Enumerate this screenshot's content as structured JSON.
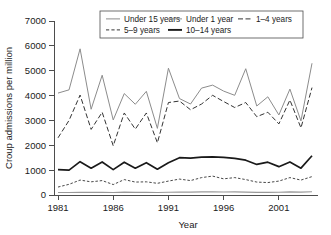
{
  "chart_data": {
    "type": "line",
    "title": "",
    "xlabel": "Year",
    "ylabel": "Croup admissions per million",
    "xlim": [
      1981,
      2004
    ],
    "ylim": [
      0,
      7000
    ],
    "grid": false,
    "legend_position": "top-right-inside",
    "x": [
      1981,
      1982,
      1983,
      1984,
      1985,
      1986,
      1987,
      1988,
      1989,
      1990,
      1991,
      1992,
      1993,
      1994,
      1995,
      1996,
      1997,
      1998,
      1999,
      2000,
      2001,
      2002,
      2003,
      2004
    ],
    "xticks": [
      1981,
      1986,
      1991,
      1996,
      2001
    ],
    "xtick_labels": [
      "1981",
      "1986",
      "1991",
      "1996",
      "2001"
    ],
    "yticks": [
      0,
      1000,
      2000,
      3000,
      4000,
      5000,
      6000,
      7000
    ],
    "ytick_labels": [
      "0",
      "1000",
      "2000",
      "3000",
      "4000",
      "5000",
      "6000",
      "7000"
    ],
    "series": [
      {
        "name": "Under 15 years",
        "style": "solid-thin",
        "color": "#8c8c8c",
        "width": 1.0,
        "dash": "",
        "values": [
          4100,
          4230,
          5880,
          3450,
          4820,
          3020,
          4080,
          3650,
          4170,
          2680,
          5100,
          3880,
          3660,
          4300,
          4420,
          4180,
          4010,
          5080,
          3580,
          3950,
          3220,
          4260,
          2980,
          5300
        ]
      },
      {
        "name": "Under 1 year",
        "style": "solid-thin",
        "color": "#8c8c8c",
        "width": 1.0,
        "dash": "",
        "values": [
          null,
          null,
          null,
          null,
          null,
          null,
          null,
          null,
          null,
          null,
          null,
          null,
          null,
          null,
          null,
          null,
          null,
          null,
          null,
          null,
          null,
          null,
          null,
          null
        ]
      },
      {
        "name": "1-4 years",
        "style": "dashed",
        "color": "#333333",
        "width": 1.0,
        "dash": "5,2.5",
        "values": [
          2300,
          3000,
          4020,
          2640,
          3330,
          1980,
          3300,
          2650,
          3300,
          2100,
          3720,
          3780,
          3430,
          3660,
          4010,
          3760,
          3520,
          3720,
          3150,
          3330,
          2860,
          3820,
          2700,
          4320
        ]
      },
      {
        "name": "5-9 years",
        "style": "dashed-short",
        "color": "#333333",
        "width": 0.9,
        "dash": "2.5,1.8",
        "values": [
          320,
          430,
          600,
          530,
          580,
          420,
          620,
          520,
          530,
          470,
          560,
          640,
          580,
          700,
          760,
          650,
          700,
          620,
          520,
          500,
          560,
          700,
          600,
          740
        ]
      },
      {
        "name": "10-14 years",
        "style": "solid-thick",
        "color": "#1a1a1a",
        "width": 1.7,
        "dash": "",
        "values": [
          1020,
          1000,
          1340,
          1080,
          1330,
          1020,
          1320,
          1080,
          1300,
          1040,
          1300,
          1500,
          1480,
          1520,
          1530,
          1510,
          1470,
          1400,
          1230,
          1320,
          1140,
          1330,
          1080,
          1580
        ]
      }
    ],
    "baseline_series": {
      "name": "baseline-10-14",
      "color": "#999999",
      "width": 1.2,
      "values": [
        100,
        100,
        110,
        105,
        110,
        100,
        115,
        105,
        110,
        100,
        110,
        120,
        115,
        125,
        130,
        120,
        125,
        115,
        105,
        105,
        110,
        125,
        115,
        130
      ]
    },
    "legend": {
      "entries": [
        {
          "label": "Under 15 years",
          "style": "solid-thin",
          "color": "#8c8c8c"
        },
        {
          "label": "Under 1 year",
          "style": "solid-thin",
          "color": "#8c8c8c"
        },
        {
          "label": "1–4 years",
          "style": "dashed",
          "color": "#333333"
        },
        {
          "label": "5–9 years",
          "style": "dashed-short",
          "color": "#333333"
        },
        {
          "label": "10–14 years",
          "style": "solid-thick",
          "color": "#1a1a1a"
        }
      ]
    }
  },
  "axes": {
    "y_title": "Croup admissions per million",
    "x_title": "Year"
  }
}
